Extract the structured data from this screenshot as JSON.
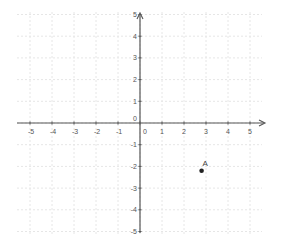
{
  "chart_data": {
    "type": "scatter",
    "title": "",
    "xlabel": "",
    "ylabel": "",
    "xlim": [
      -5.5,
      5.5
    ],
    "ylim": [
      -5.3,
      5.3
    ],
    "grid": true,
    "x_ticks": [
      "-5",
      "-4",
      "-3",
      "-2",
      "-1",
      "0",
      "1",
      "2",
      "3",
      "4",
      "5"
    ],
    "y_ticks": [
      "5",
      "4",
      "3",
      "2",
      "1",
      "0",
      "-1",
      "-2",
      "-3",
      "-4",
      "-5"
    ],
    "points": [
      {
        "label": "A",
        "x": 2.8,
        "y": -2.2
      }
    ]
  },
  "colors": {
    "axis": "#555555",
    "grid": "#e6e6e6",
    "point": "#222222"
  }
}
